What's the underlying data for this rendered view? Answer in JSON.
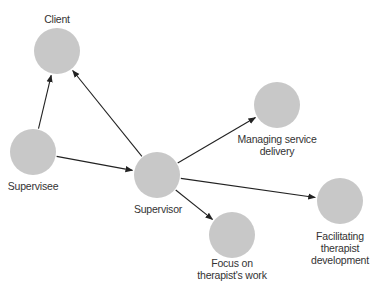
{
  "diagram": {
    "node_color": "#c8c8c8",
    "edge_color": "#222222",
    "nodes": [
      {
        "id": "client",
        "label_lines": [
          "Client"
        ],
        "cx": 57,
        "cy": 51,
        "r": 23,
        "label_x": 57,
        "label_y": 13
      },
      {
        "id": "supervisee",
        "label_lines": [
          "Supervisee"
        ],
        "cx": 33,
        "cy": 152,
        "r": 23,
        "label_x": 33,
        "label_y": 180
      },
      {
        "id": "supervisor",
        "label_lines": [
          "Supervisor"
        ],
        "cx": 157,
        "cy": 175,
        "r": 23,
        "label_x": 158,
        "label_y": 203
      },
      {
        "id": "managing",
        "label_lines": [
          "Managing service",
          "delivery"
        ],
        "cx": 277,
        "cy": 105,
        "r": 23,
        "label_x": 277,
        "label_y": 133
      },
      {
        "id": "focus",
        "label_lines": [
          "Focus on",
          "therapist's work"
        ],
        "cx": 232,
        "cy": 235,
        "r": 23,
        "label_x": 232,
        "label_y": 257
      },
      {
        "id": "facilitating",
        "label_lines": [
          "Facilitating",
          "therapist",
          "development"
        ],
        "cx": 340,
        "cy": 201,
        "r": 23,
        "label_x": 340,
        "label_y": 230
      }
    ],
    "edges": [
      {
        "from": "supervisee",
        "to": "client"
      },
      {
        "from": "supervisor",
        "to": "client"
      },
      {
        "from": "supervisee",
        "to": "supervisor"
      },
      {
        "from": "supervisor",
        "to": "managing"
      },
      {
        "from": "supervisor",
        "to": "focus"
      },
      {
        "from": "supervisor",
        "to": "facilitating"
      }
    ]
  }
}
